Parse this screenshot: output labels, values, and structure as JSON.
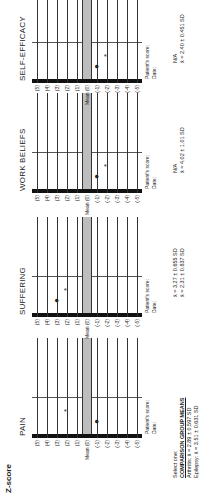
{
  "title": "Z-score",
  "row_labels": [
    "(5)",
    "(4)",
    "(3)",
    "(2)",
    "(1)",
    "Mean (0)",
    "(-1)",
    "(-2)",
    "(-3)",
    "(-4)",
    "(-5)"
  ],
  "footer": {
    "score_label": "Patient's score:",
    "date_label": "Date:"
  },
  "panels": [
    {
      "name": "PAIN",
      "dot_row": 6,
      "star_row": 3,
      "stat1": "Select one:",
      "stat2": "COMPARISON GROUP MEANS",
      "stat3": "Arthritis:   x̄ = 2.89 ± 0.597 SD",
      "stat4": "Epilepsy:   x̄ = 3.51 ± 0.631 SD"
    },
    {
      "name": "SUFFERING",
      "dot_row": 2,
      "star_row": 3,
      "stat1": "x̄ = 3.27 ± 0.655 SD",
      "stat2": "x̄ = 2.31 ± 0.837 SD"
    },
    {
      "name": "WORK BELIEFS",
      "dot_row": 6,
      "star_row": 7,
      "stat1": "N/A",
      "stat2": "x̄ = 4.02 ± 1.01 SD"
    },
    {
      "name": "SELF-EFFICACY",
      "dot_row": 6,
      "star_row": 7,
      "stat1": "N/A",
      "stat2": "x̄ = 2.40 ± 0.451 SD"
    }
  ],
  "chart_data": {
    "type": "table",
    "title": "Z-score",
    "rows": [
      "(5)",
      "(4)",
      "(3)",
      "(2)",
      "(1)",
      "Mean (0)",
      "(-1)",
      "(-2)",
      "(-3)",
      "(-4)",
      "(-5)"
    ],
    "series": [
      {
        "name": "PAIN",
        "dot": -1,
        "star": 2
      },
      {
        "name": "SUFFERING",
        "dot": 3,
        "star": 2
      },
      {
        "name": "WORK BELIEFS",
        "dot": -1,
        "star": -2
      },
      {
        "name": "SELF-EFFICACY",
        "dot": -1,
        "star": -2
      }
    ],
    "comparison_group_means": {
      "PAIN": {
        "Arthritis": "2.89 ± 0.597 SD",
        "Epilepsy": "3.51 ± 0.631 SD"
      },
      "SUFFERING": {
        "Arthritis": "3.27 ± 0.655 SD",
        "Epilepsy": "2.31 ± 0.837 SD"
      },
      "WORK BELIEFS": {
        "Arthritis": "N/A",
        "Epilepsy": "4.02 ± 1.01 SD"
      },
      "SELF-EFFICACY": {
        "Arthritis": "N/A",
        "Epilepsy": "2.40 ± 0.451 SD"
      }
    }
  }
}
